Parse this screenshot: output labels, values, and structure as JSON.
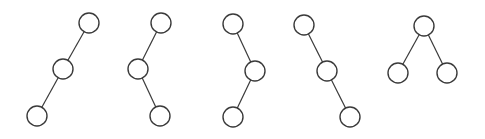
{
  "diagram": {
    "type": "binary-tree-shapes",
    "node_radius": 10,
    "stroke_color": "#3a3a3a",
    "fill_color": "#ffffff",
    "trees": [
      {
        "name": "left-left-chain",
        "nodes": [
          {
            "x": 89,
            "y": 23
          },
          {
            "x": 63,
            "y": 69
          },
          {
            "x": 37,
            "y": 116
          }
        ],
        "edges": [
          [
            0,
            1
          ],
          [
            1,
            2
          ]
        ]
      },
      {
        "name": "left-right-zigzag",
        "nodes": [
          {
            "x": 161,
            "y": 23
          },
          {
            "x": 138,
            "y": 69
          },
          {
            "x": 160,
            "y": 116
          }
        ],
        "edges": [
          [
            0,
            1
          ],
          [
            1,
            2
          ]
        ]
      },
      {
        "name": "right-left-zigzag",
        "nodes": [
          {
            "x": 233,
            "y": 24
          },
          {
            "x": 255,
            "y": 71
          },
          {
            "x": 233,
            "y": 117
          }
        ],
        "edges": [
          [
            0,
            1
          ],
          [
            1,
            2
          ]
        ]
      },
      {
        "name": "right-right-chain",
        "nodes": [
          {
            "x": 304,
            "y": 25
          },
          {
            "x": 327,
            "y": 71
          },
          {
            "x": 350,
            "y": 117
          }
        ],
        "edges": [
          [
            0,
            1
          ],
          [
            1,
            2
          ]
        ]
      },
      {
        "name": "balanced",
        "nodes": [
          {
            "x": 424,
            "y": 26
          },
          {
            "x": 398,
            "y": 73
          },
          {
            "x": 447,
            "y": 73
          }
        ],
        "edges": [
          [
            0,
            1
          ],
          [
            0,
            2
          ]
        ]
      }
    ]
  }
}
